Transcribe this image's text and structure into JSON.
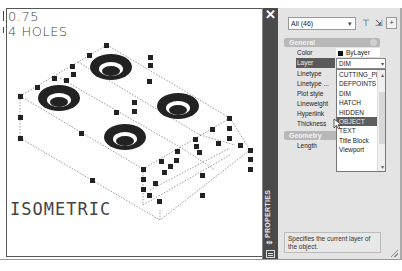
{
  "drawing": {
    "notes": [
      "0.75",
      "4 HOLES"
    ],
    "view_label": "ISOMETRIC",
    "hole_count": 4
  },
  "palette": {
    "title": "PROPERTIES",
    "close_icon": "close-icon",
    "selection_filter": "All (46)",
    "toolbar_icons": [
      "toggle-pickadd-icon",
      "select-objects-icon",
      "quick-select-icon"
    ],
    "sections": [
      {
        "name": "General",
        "rows": [
          {
            "label": "Color",
            "value": "ByLayer",
            "swatch": "#111111"
          },
          {
            "label": "Layer",
            "value": "DIM",
            "selected": true
          },
          {
            "label": "Linetype",
            "value": ""
          },
          {
            "label": "Linetype ...",
            "value": ""
          },
          {
            "label": "Plot style",
            "value": ""
          },
          {
            "label": "Lineweight",
            "value": ""
          },
          {
            "label": "Hyperlink",
            "value": ""
          },
          {
            "label": "Thickness",
            "value": ""
          }
        ]
      },
      {
        "name": "Geometry",
        "rows": [
          {
            "label": "Length",
            "value": ""
          }
        ]
      }
    ],
    "layer_dropdown": {
      "current": "DIM",
      "options": [
        "CUTTING_PL...",
        "DEFPOINTS",
        "DIM",
        "HATCH",
        "HIDDEN",
        "OBJECT",
        "TEXT",
        "Title Block",
        "Viewport"
      ],
      "highlighted": "OBJECT"
    },
    "description": "Specifies the current layer of the object."
  }
}
